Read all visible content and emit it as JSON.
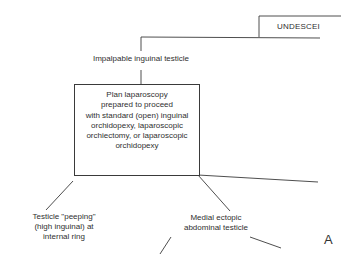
{
  "diagram": {
    "root_node": {
      "label": "UNDESCEI"
    },
    "nodes": {
      "impalpable": {
        "label": "Impalpable inguinal testicle"
      },
      "plan_box": {
        "lines": [
          "Plan laparoscopy",
          "prepared to proceed",
          "with standard (open) inguinal",
          "orchidopexy, laparoscopic",
          "orchiectomy, or laparoscopic",
          "orchidopexy"
        ]
      },
      "peeping": {
        "lines": [
          "Testicle \"peeping\"",
          "(high inguinal) at",
          "internal ring"
        ]
      },
      "medial_ectopic": {
        "lines": [
          "Medial ectopic",
          "abdominal testicle"
        ]
      }
    },
    "panel_label": "A",
    "colors": {
      "line": "#3a3a3a",
      "text": "#2f2f2f",
      "background": "#ffffff"
    }
  }
}
